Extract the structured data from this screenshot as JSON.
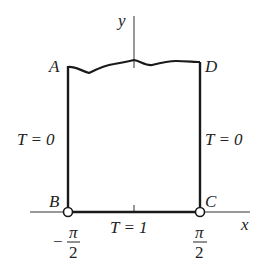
{
  "diagram": {
    "axes": {
      "x_label": "x",
      "y_label": "y"
    },
    "corners": {
      "A": "A",
      "B": "B",
      "C": "C",
      "D": "D"
    },
    "boundary_conditions": {
      "left": "T = 0",
      "right": "T = 0",
      "bottom": "T = 1"
    },
    "tick_labels": {
      "left": {
        "sign": "−",
        "numerator": "π",
        "denominator": "2"
      },
      "right": {
        "numerator": "π",
        "denominator": "2"
      }
    },
    "colors": {
      "stroke": "#1a1a1a",
      "text": "#222222",
      "background": "#ffffff"
    }
  }
}
